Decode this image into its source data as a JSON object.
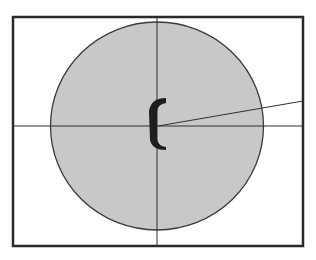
{
  "diagram": {
    "frame": {
      "x": 13,
      "y": 17,
      "width": 290,
      "height": 229,
      "stroke": "#2a2a2a"
    },
    "circle": {
      "cx": 157,
      "cy": 126,
      "rx": 106.5,
      "ry": 104,
      "fill": "#c8c8c8",
      "stroke": "#3a3a3a"
    },
    "crosshair": {
      "x": 157,
      "y": 126,
      "stroke": "#2f2f2f"
    },
    "ray": {
      "x1": 158,
      "y1": 126,
      "x2": 303,
      "y2": 101,
      "stroke": "#2f2f2f"
    },
    "marker": {
      "shape": "c-bracket",
      "color": "#1e1e1e"
    }
  }
}
